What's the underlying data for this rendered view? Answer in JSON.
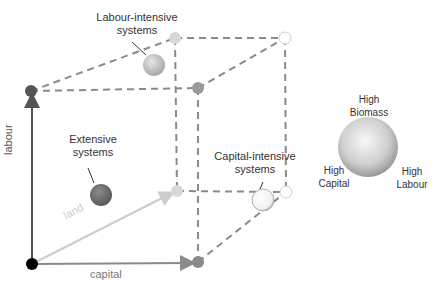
{
  "labels": {
    "labour_intensive": "Labour-intensive\nsystems",
    "extensive": "Extensive\nsystems",
    "capital_intensive": "Capital-intensive\nsystems"
  },
  "axes": {
    "labour": "labour",
    "land": "land",
    "capital": "capital"
  },
  "legend": {
    "top": "High\nBiomass",
    "left": "High\nCapital",
    "right": "High\nLabour"
  },
  "colors": {
    "labour_axis": "#555555",
    "land_axis": "#cccccc",
    "capital_axis": "#8a8a8a",
    "dash": "#8a8a8a",
    "origin": "#000000"
  }
}
